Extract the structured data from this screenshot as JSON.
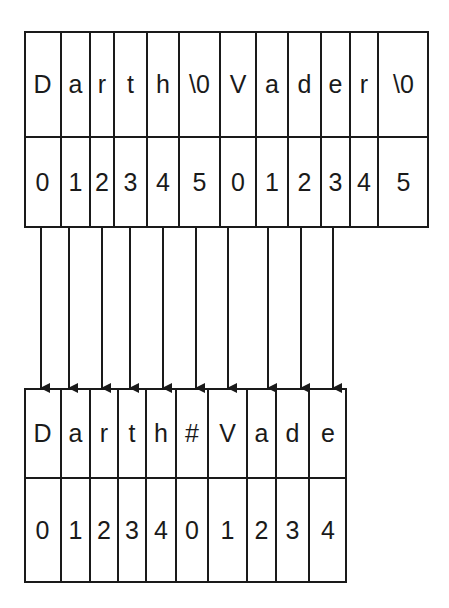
{
  "source_array": {
    "chars": [
      "D",
      "a",
      "r",
      "t",
      "h",
      "\\0",
      "V",
      "a",
      "d",
      "e",
      "r",
      "\\0"
    ],
    "indices": [
      "0",
      "1",
      "2",
      "3",
      "4",
      "5",
      "0",
      "1",
      "2",
      "3",
      "4",
      "5"
    ]
  },
  "dest_array": {
    "chars": [
      "D",
      "a",
      "r",
      "t",
      "h",
      "#",
      "V",
      "a",
      "d",
      "e"
    ],
    "indices": [
      "0",
      "1",
      "2",
      "3",
      "4",
      "0",
      "1",
      "2",
      "3",
      "4"
    ]
  },
  "arrow_count": 10
}
